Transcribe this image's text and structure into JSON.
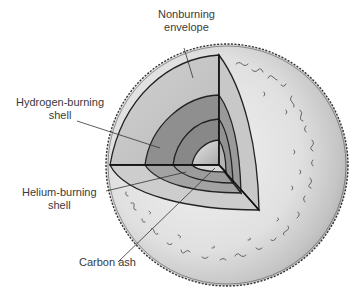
{
  "labels": {
    "nonburning_envelope": {
      "line1": "Nonburning",
      "line2": "envelope"
    },
    "hydrogen_shell": {
      "line1": "Hydrogen-burning",
      "line2": "shell"
    },
    "helium_shell": {
      "line1": "Helium-burning",
      "line2": "shell"
    },
    "carbon_ash": {
      "line1": "Carbon ash"
    }
  },
  "colors": {
    "sphere_surface": "#d9d9d9",
    "envelope_cut": "#c2c2c2",
    "hydrogen_shell": "#8f8f8f",
    "helium_shell": "#a0a0a0",
    "carbon_core": "#d0d0d0",
    "outline": "#222222",
    "label_text": "#3a3a3a"
  }
}
